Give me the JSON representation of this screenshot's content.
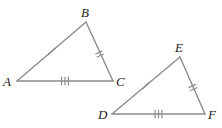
{
  "figure": {
    "type": "geometry-diagram",
    "width": 222,
    "height": 128,
    "background_color": "#ffffff",
    "stroke_color": "#8c8c8c",
    "tick_color": "#8c8c8c",
    "label_color": "#1a1a1a",
    "stroke_width": 1.4
  },
  "triangles": [
    {
      "name": "triangle-abc",
      "vertices": [
        {
          "label": "A",
          "x": 17,
          "y": 81,
          "label_x": 3,
          "label_y": 86
        },
        {
          "label": "B",
          "x": 86,
          "y": 22,
          "label_x": 81,
          "label_y": 17
        },
        {
          "label": "C",
          "x": 113,
          "y": 81,
          "label_x": 116,
          "label_y": 86
        }
      ],
      "sides": [
        {
          "name": "side-ab",
          "from": "A",
          "to": "B",
          "ticks": 1,
          "tick_x": 51.5,
          "tick_y": 51.5
        },
        {
          "name": "side-bc",
          "from": "B",
          "to": "C",
          "ticks": 2,
          "tick_x": 99.5,
          "tick_y": 51.5
        },
        {
          "name": "side-ac",
          "from": "A",
          "to": "C",
          "ticks": 3,
          "tick_x": 65,
          "tick_y": 81
        }
      ]
    },
    {
      "name": "triangle-def",
      "vertices": [
        {
          "label": "D",
          "x": 112,
          "y": 114,
          "label_x": 98,
          "label_y": 119
        },
        {
          "label": "E",
          "x": 180,
          "y": 57,
          "label_x": 175,
          "label_y": 52
        },
        {
          "label": "F",
          "x": 205,
          "y": 114,
          "label_x": 208,
          "label_y": 119
        }
      ],
      "sides": [
        {
          "name": "side-de",
          "from": "D",
          "to": "E",
          "ticks": 1,
          "tick_x": 146,
          "tick_y": 85.5
        },
        {
          "name": "side-ef",
          "from": "E",
          "to": "F",
          "ticks": 2,
          "tick_x": 192.5,
          "tick_y": 85.5
        },
        {
          "name": "side-df",
          "from": "D",
          "to": "F",
          "ticks": 3,
          "tick_x": 158.5,
          "tick_y": 114
        }
      ]
    }
  ],
  "labels": {
    "a": "A",
    "b": "B",
    "c": "C",
    "d": "D",
    "e": "E",
    "f": "F"
  }
}
